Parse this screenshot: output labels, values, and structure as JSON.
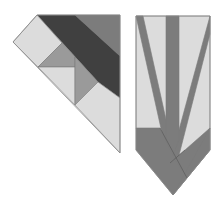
{
  "diagram": {
    "colors": {
      "light": "#dcdcdc",
      "medium": "#9a9a9a",
      "mid_dark": "#7c7c7c",
      "dark": "#404040",
      "outline": "#7a7a7a"
    },
    "left_block": {
      "name": "corner-triangle-block",
      "pieces": [
        {
          "id": "light-square-top",
          "shade": "light"
        },
        {
          "id": "dark-diagonal-band",
          "shade": "dark"
        },
        {
          "id": "mid-dark-top-right",
          "shade": "mid_dark"
        },
        {
          "id": "medium-triangle-upper",
          "shade": "medium"
        },
        {
          "id": "light-triangle-middle",
          "shade": "light"
        },
        {
          "id": "medium-triangle-lower",
          "shade": "medium"
        },
        {
          "id": "light-square-bottom",
          "shade": "light"
        }
      ]
    },
    "right_block": {
      "name": "pointed-strip-block",
      "pieces": [
        {
          "id": "light-background",
          "shade": "light"
        },
        {
          "id": "center-vertical-strip",
          "shade": "mid_dark"
        },
        {
          "id": "left-diagonal-strip",
          "shade": "mid_dark"
        },
        {
          "id": "right-diagonal-strip",
          "shade": "mid_dark"
        },
        {
          "id": "bottom-left-chevron",
          "shade": "mid_dark"
        },
        {
          "id": "bottom-right-chevron",
          "shade": "mid_dark"
        }
      ]
    }
  }
}
